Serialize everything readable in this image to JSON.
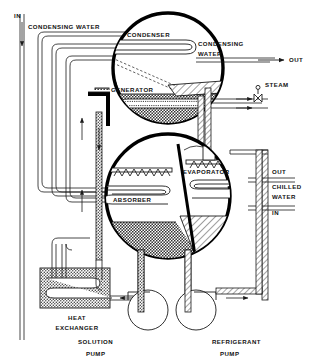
{
  "diagram": {
    "type": "process-flow-schematic",
    "components": {
      "condenser": "CONDENSER",
      "generator": "GENERATOR",
      "absorber": "ABSORBER",
      "evaporator": "EVAPORATOR",
      "heat_exchanger_line1": "HEAT",
      "heat_exchanger_line2": "EXCHANGER",
      "solution_pump_line1": "SOLUTION",
      "solution_pump_line2": "PUMP",
      "refrigerant_pump_line1": "REFRIGERANT",
      "refrigerant_pump_line2": "PUMP"
    },
    "streams": {
      "condensing_water_in_label": "IN",
      "condensing_water_inlet_name": "CONDENSING WATER",
      "condensing_water_out_line1": "CONDENSING",
      "condensing_water_out_line2": "WATER",
      "condensing_water_out_label": "OUT",
      "steam_label": "STEAM",
      "chilled_water_out_label": "OUT",
      "chilled_water_name_line1": "CHILLED",
      "chilled_water_name_line2": "WATER",
      "chilled_water_in_label": "IN"
    },
    "colors": {
      "line": "#1a1a1a",
      "vessel_shell": "#000000",
      "solution_fill": "#6f6f6f",
      "refrigerant_fill": "#ffffff",
      "background": "#ffffff"
    }
  }
}
